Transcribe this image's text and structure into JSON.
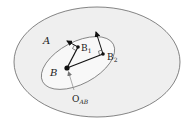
{
  "diagram": {
    "labels": {
      "region_a": "A",
      "region_b": "B",
      "point_b1": "B",
      "point_b1_sub": "1",
      "point_b2": "B",
      "point_b2_sub": "2",
      "origin": "O",
      "origin_sub": "AB"
    },
    "colors": {
      "outer_fill": "#efefef",
      "inner_fill": "#f7f7f7",
      "stroke": "#555555",
      "ink": "#111111"
    }
  }
}
